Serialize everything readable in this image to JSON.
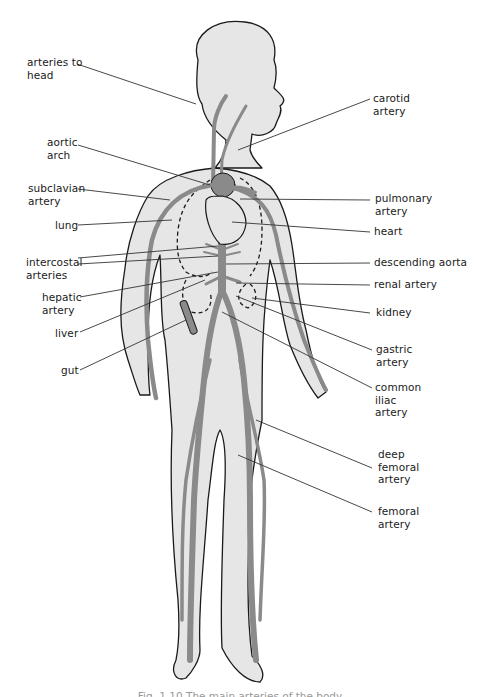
{
  "figure": {
    "colors": {
      "skin_fill": "#e6e6e6",
      "outline": "#1a1a1a",
      "artery_fill": "#8a8a8a",
      "leader_line": "#333333",
      "background": "#ffffff"
    }
  },
  "labels_left": [
    {
      "id": "arteries-to-head",
      "text": "arteries to\nhead"
    },
    {
      "id": "aortic-arch",
      "text": "aortic\narch"
    },
    {
      "id": "subclavian-artery",
      "text": "subclavian\nartery"
    },
    {
      "id": "lung",
      "text": "lung"
    },
    {
      "id": "intercostal-arteries",
      "text": "intercostal\narteries"
    },
    {
      "id": "hepatic-artery",
      "text": "hepatic\nartery"
    },
    {
      "id": "liver",
      "text": "liver"
    },
    {
      "id": "gut",
      "text": "gut"
    }
  ],
  "labels_right": [
    {
      "id": "carotid-artery",
      "text": "carotid\nartery"
    },
    {
      "id": "pulmonary-artery",
      "text": "pulmonary\nartery"
    },
    {
      "id": "heart",
      "text": "heart"
    },
    {
      "id": "descending-aorta",
      "text": "descending aorta"
    },
    {
      "id": "renal-artery",
      "text": "renal artery"
    },
    {
      "id": "kidney",
      "text": "kidney"
    },
    {
      "id": "gastric-artery",
      "text": "gastric\nartery"
    },
    {
      "id": "common-iliac-artery",
      "text": "common\niliac\nartery"
    },
    {
      "id": "deep-femoral-artery",
      "text": "deep\nfemoral\nartery"
    },
    {
      "id": "femoral-artery",
      "text": "femoral\nartery"
    }
  ],
  "caption": {
    "text": "Fig. 1.10  The main arteries of the body"
  }
}
